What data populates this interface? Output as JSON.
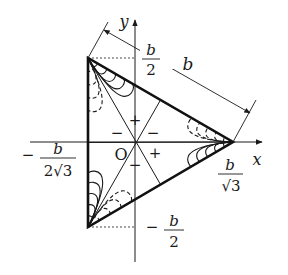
{
  "figure": {
    "axes": {
      "x_label": "x",
      "y_label": "y",
      "origin_label": "O"
    },
    "dimension_label": "b",
    "labels": {
      "top_frac": {
        "sign": "",
        "num": "b",
        "den": "2"
      },
      "bottom_frac": {
        "sign": "−",
        "num": "b",
        "den": "2"
      },
      "left_frac": {
        "sign": "−",
        "num": "b",
        "den": "2√3"
      },
      "right_frac": {
        "sign": "",
        "num": "b",
        "den": "√3"
      }
    },
    "signs": {
      "top": "+",
      "upper_left": "−",
      "upper_right": "−",
      "right": "+",
      "lower_left": "+",
      "bottom": "−"
    },
    "colors": {
      "ink": "#1a1a1a",
      "background": "#ffffff"
    }
  }
}
